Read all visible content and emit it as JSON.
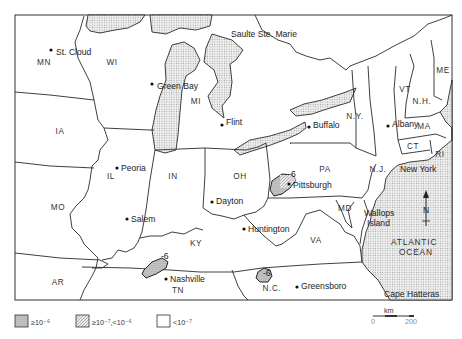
{
  "map": {
    "states": [
      {
        "code": "MN",
        "x": 44,
        "y": 65
      },
      {
        "code": "WI",
        "x": 112,
        "y": 65
      },
      {
        "code": "MI",
        "x": 196,
        "y": 104
      },
      {
        "code": "IA",
        "x": 60,
        "y": 134
      },
      {
        "code": "IL",
        "x": 111,
        "y": 179
      },
      {
        "code": "IN",
        "x": 173,
        "y": 179
      },
      {
        "code": "OH",
        "x": 240,
        "y": 179
      },
      {
        "code": "PA",
        "x": 325,
        "y": 172
      },
      {
        "code": "N.Y.",
        "x": 355,
        "y": 119
      },
      {
        "code": "VT",
        "x": 405,
        "y": 92
      },
      {
        "code": "N.H.",
        "x": 422,
        "y": 104
      },
      {
        "code": "ME",
        "x": 443,
        "y": 73
      },
      {
        "code": "MA",
        "x": 424,
        "y": 129
      },
      {
        "code": "CT",
        "x": 413,
        "y": 149
      },
      {
        "code": "RI",
        "x": 440,
        "y": 157
      },
      {
        "code": "N.J.",
        "x": 378,
        "y": 172
      },
      {
        "code": "MD",
        "x": 345,
        "y": 211
      },
      {
        "code": "VA",
        "x": 316,
        "y": 243
      },
      {
        "code": "MO",
        "x": 58,
        "y": 210
      },
      {
        "code": "KY",
        "x": 196,
        "y": 246
      },
      {
        "code": "TN",
        "x": 178,
        "y": 293
      },
      {
        "code": "N.C.",
        "x": 272,
        "y": 291
      },
      {
        "code": "AR",
        "x": 58,
        "y": 285
      }
    ],
    "cities": [
      {
        "name": "St. Cloud",
        "dot_x": 51,
        "dot_y": 50,
        "x": 56,
        "y": 52
      },
      {
        "name": "Green Bay",
        "dot_x": 152,
        "dot_y": 84,
        "x": 157,
        "y": 86
      },
      {
        "name": "Flint",
        "dot_x": 222,
        "dot_y": 125,
        "x": 226,
        "y": 122
      },
      {
        "name": "Buffalo",
        "dot_x": 309,
        "dot_y": 127,
        "x": 313,
        "y": 125
      },
      {
        "name": "Albany",
        "dot_x": 388,
        "dot_y": 126,
        "x": 392,
        "y": 124
      },
      {
        "name": "Peoria",
        "dot_x": 117,
        "dot_y": 168,
        "x": 121,
        "y": 168
      },
      {
        "name": "Pittsburgh",
        "dot_x": 289,
        "dot_y": 184,
        "x": 293,
        "y": 185
      },
      {
        "name": "Dayton",
        "dot_x": 212,
        "dot_y": 202,
        "x": 216,
        "y": 201
      },
      {
        "name": "Salem",
        "dot_x": 127,
        "dot_y": 219,
        "x": 131,
        "y": 219
      },
      {
        "name": "Huntington",
        "dot_x": 244,
        "dot_y": 229,
        "x": 248,
        "y": 229
      },
      {
        "name": "Nashville",
        "dot_x": 166,
        "dot_y": 279,
        "x": 170,
        "y": 279
      },
      {
        "name": "Greensboro",
        "dot_x": 297,
        "dot_y": 287,
        "x": 301,
        "y": 286
      }
    ],
    "other_labels": [
      {
        "id": "sault",
        "text": "Saulte Ste. Marie",
        "x": 231,
        "y": 37
      },
      {
        "id": "newyork",
        "text": "New York",
        "x": 400,
        "y": 172
      },
      {
        "id": "wallops1",
        "text": "Wallops",
        "x": 364,
        "y": 216
      },
      {
        "id": "wallops2",
        "text": "Island",
        "x": 367,
        "y": 226
      },
      {
        "id": "ocean1",
        "text": "ATLANTIC",
        "x": 391,
        "y": 245
      },
      {
        "id": "ocean2",
        "text": "OCEAN",
        "x": 399,
        "y": 255
      },
      {
        "id": "cape",
        "text": "Cape Hatteras",
        "x": 384,
        "y": 297
      }
    ],
    "contour_labels": [
      {
        "text": "6",
        "x": 291,
        "y": 177
      },
      {
        "text": "-6",
        "x": 161,
        "y": 259
      },
      {
        "text": "-6",
        "x": 263,
        "y": 276
      }
    ],
    "north_arrow": {
      "label": "N"
    }
  },
  "legend": {
    "items": [
      {
        "pattern": "dense-stipple",
        "label": "≥10⁻⁶"
      },
      {
        "pattern": "hatch",
        "label": "≥10⁻⁷,<10⁻⁶"
      },
      {
        "pattern": "blank",
        "label": "<10⁻⁷"
      }
    ]
  },
  "scale_bar": {
    "unit": "km",
    "min": "0",
    "max": "200"
  },
  "colors": {
    "ink": "#2a2a2a",
    "water_fill": "#d9d9d9",
    "paper": "#ffffff"
  }
}
